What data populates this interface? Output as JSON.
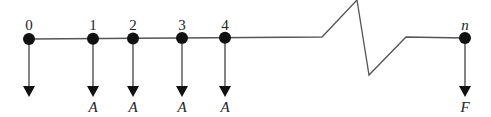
{
  "diagram": {
    "type": "cash-flow-timeline",
    "periods": [
      {
        "label": "0",
        "x": 29,
        "flow_label": ""
      },
      {
        "label": "1",
        "x": 93,
        "flow_label": "A"
      },
      {
        "label": "2",
        "x": 133,
        "flow_label": "A"
      },
      {
        "label": "3",
        "x": 182,
        "flow_label": "A"
      },
      {
        "label": "4",
        "x": 225,
        "flow_label": "A"
      },
      {
        "label": "n",
        "x": 465,
        "flow_label": "F"
      }
    ],
    "line_color": "#555555",
    "dot_color": "#111111"
  }
}
